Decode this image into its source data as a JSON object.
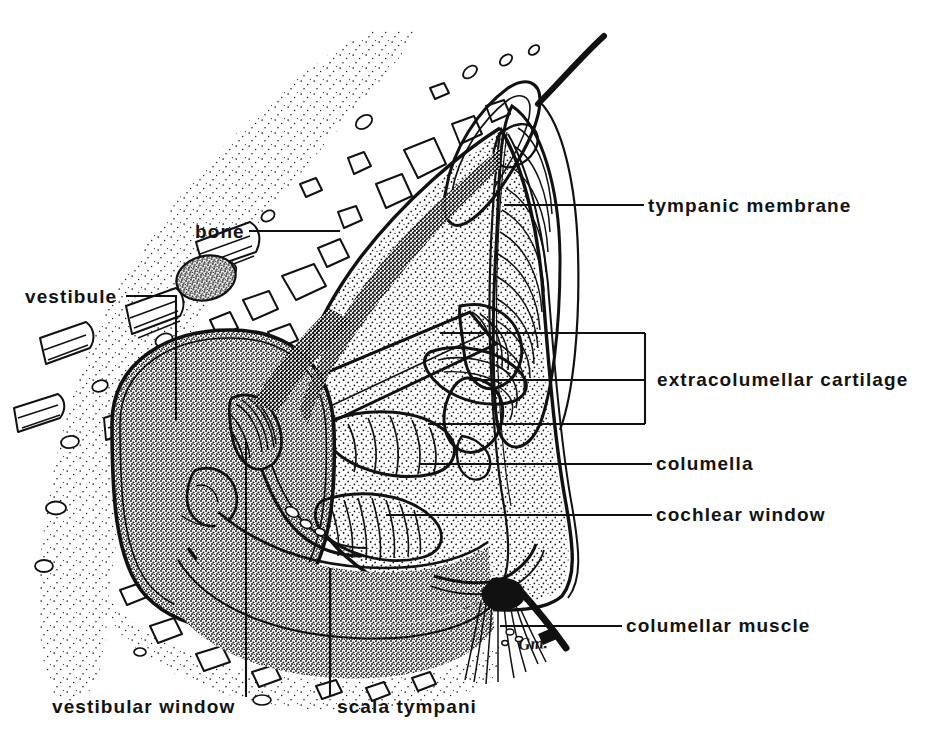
{
  "figure": {
    "kind": "anatomical-line-drawing",
    "artist_signature": "Gm.",
    "background_color": "#ffffff",
    "ink_color": "#111111"
  },
  "labels": {
    "bone": "bone",
    "vestibule": "vestibule",
    "tympanic_membrane": "tympanic membrane",
    "extracolumellar_cartilage": "extracolumellar cartilage",
    "columella": "columella",
    "cochlear_window": "cochlear window",
    "columellar_muscle": "columellar muscle",
    "vestibular_window": "vestibular window",
    "scala_tympani": "scala tympani"
  },
  "label_list": [
    {
      "id": "bone",
      "text": "bone",
      "side": "left",
      "x": 195,
      "y": 222
    },
    {
      "id": "vestibule",
      "text": "vestibule",
      "side": "left",
      "x": 25,
      "y": 289
    },
    {
      "id": "tympanic-membrane",
      "text": "tympanic membrane",
      "side": "right",
      "x": 648,
      "y": 198
    },
    {
      "id": "extracolumellar-cartilage",
      "text": "extracolumellar cartilage",
      "side": "right",
      "x": 657,
      "y": 370
    },
    {
      "id": "columella",
      "text": "columella",
      "side": "right",
      "x": 656,
      "y": 456
    },
    {
      "id": "cochlear-window",
      "text": "cochlear window",
      "side": "right",
      "x": 656,
      "y": 507
    },
    {
      "id": "columellar-muscle",
      "text": "columellar muscle",
      "side": "right",
      "x": 626,
      "y": 618
    },
    {
      "id": "vestibular-window",
      "text": "vestibular window",
      "side": "bottom",
      "x": 52,
      "y": 700
    },
    {
      "id": "scala-tympani",
      "text": "scala tympani",
      "side": "bottom",
      "x": 337,
      "y": 700
    }
  ],
  "signature": {
    "text": "Gm.",
    "x": 520,
    "y": 645
  }
}
